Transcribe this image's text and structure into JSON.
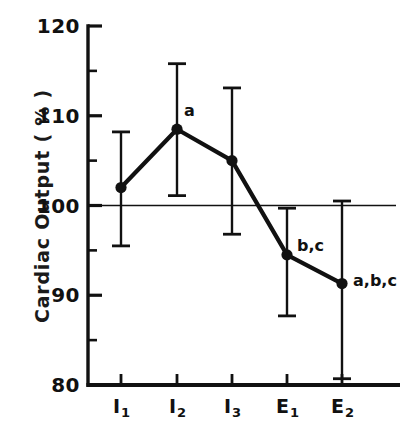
{
  "chart_data": {
    "type": "line",
    "title": "",
    "xlabel": "",
    "ylabel": "Cardiac Output ( % )",
    "categories": [
      "I1",
      "I2",
      "I3",
      "E1",
      "E2"
    ],
    "category_labels": [
      {
        "base": "I",
        "sub": "1"
      },
      {
        "base": "I",
        "sub": "2"
      },
      {
        "base": "I",
        "sub": "3"
      },
      {
        "base": "E",
        "sub": "1"
      },
      {
        "base": "E",
        "sub": "2"
      }
    ],
    "values": [
      102.0,
      108.5,
      105.0,
      94.5,
      91.3
    ],
    "error_upper": [
      108.2,
      115.8,
      113.1,
      99.7,
      100.5
    ],
    "error_lower": [
      95.5,
      101.1,
      96.8,
      87.7,
      80.7
    ],
    "point_annotations": [
      "",
      "a",
      "",
      "b,c",
      "a,b,c"
    ],
    "ylim": [
      80,
      120
    ],
    "ytick_labels": [
      "120",
      "110",
      "100",
      "90",
      "80"
    ],
    "ytick_values": [
      120,
      110,
      100,
      90,
      80
    ],
    "yminor_values": [
      115,
      105,
      95,
      85
    ],
    "reference_line": 100,
    "grid": false,
    "legend": "none",
    "marker": "filled-circle",
    "line_color": "#111111",
    "background_color": "#ffffff"
  },
  "axis_geometry": {
    "left_px": 88,
    "right_px": 400,
    "top_px": 26,
    "bottom_px": 385,
    "x_positions_px": [
      121,
      177,
      232,
      287,
      342
    ]
  }
}
